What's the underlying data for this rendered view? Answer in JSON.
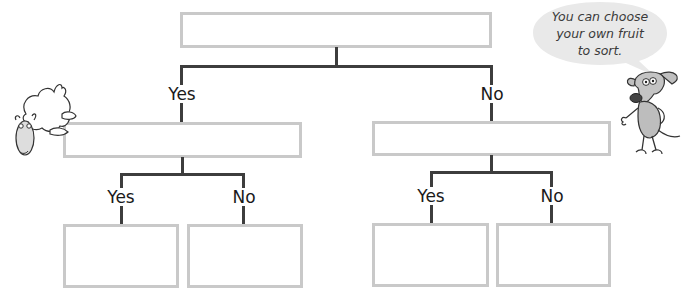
{
  "diagram": {
    "type": "decision-tree",
    "root": {
      "text": "",
      "branches": [
        {
          "label": "Yes",
          "node": {
            "text": "",
            "branches": [
              {
                "label": "Yes",
                "node": {
                  "text": ""
                }
              },
              {
                "label": "No",
                "node": {
                  "text": ""
                }
              }
            ]
          }
        },
        {
          "label": "No",
          "node": {
            "text": "",
            "branches": [
              {
                "label": "Yes",
                "node": {
                  "text": ""
                }
              },
              {
                "label": "No",
                "node": {
                  "text": ""
                }
              }
            ]
          }
        }
      ]
    },
    "labels": {
      "l1_yes": "Yes",
      "l1_no": "No",
      "l2_left_yes": "Yes",
      "l2_left_no": "No",
      "l2_right_yes": "Yes",
      "l2_right_no": "No"
    }
  },
  "speech_bubble": {
    "lines": [
      "You can choose",
      "your own fruit",
      "to sort."
    ]
  },
  "characters": {
    "left": "sheep-icon",
    "right": "dog-icon"
  },
  "colors": {
    "box_border": "#c9c9c9",
    "connector": "#3d3d3d",
    "bubble_fill": "#e9e9e9"
  }
}
